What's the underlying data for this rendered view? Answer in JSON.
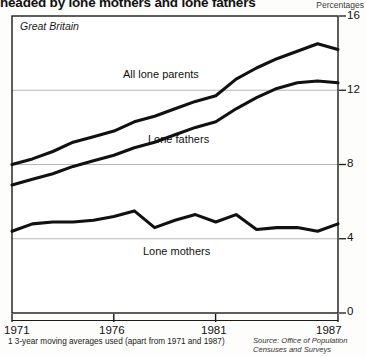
{
  "title": "headed by lone mothers and lone fathers",
  "units_label": "Percentages",
  "region_label": "Great Britain",
  "footnote": "1  3-year moving averages used (apart from 1971 and 1987)",
  "source_line1": "Source: Office of Population",
  "source_line2": "Censuses and Surveys",
  "labels": {
    "all_lone_parents": "All lone parents",
    "lone_fathers": "Lone fathers",
    "lone_mothers": "Lone mothers"
  },
  "axis": {
    "y_ticks": [
      "16",
      "12",
      "8",
      "4",
      "0"
    ],
    "x_ticks": [
      "1971",
      "1976",
      "1981",
      "1987"
    ]
  },
  "chart_data": {
    "type": "line",
    "title": "headed by lone mothers and lone fathers",
    "subtitle": "Great Britain",
    "xlabel": "",
    "ylabel": "Percentages",
    "ylim": [
      0,
      16
    ],
    "xlim": [
      1971,
      1987
    ],
    "grid": true,
    "legend": "inline-annotations",
    "yticks": [
      0,
      4,
      8,
      12,
      16
    ],
    "xticks": [
      1971,
      1976,
      1981,
      1987
    ],
    "x": [
      1971,
      1972,
      1973,
      1974,
      1975,
      1976,
      1977,
      1978,
      1979,
      1980,
      1981,
      1982,
      1983,
      1984,
      1985,
      1986,
      1987
    ],
    "series": [
      {
        "name": "All lone parents",
        "values": [
          8.0,
          8.3,
          8.7,
          9.2,
          9.5,
          9.8,
          10.3,
          10.6,
          11.0,
          11.4,
          11.7,
          12.6,
          13.2,
          13.7,
          14.1,
          14.5,
          14.2
        ]
      },
      {
        "name": "Lone fathers",
        "values": [
          6.9,
          7.2,
          7.5,
          7.9,
          8.2,
          8.5,
          8.9,
          9.2,
          9.6,
          10.0,
          10.3,
          11.0,
          11.6,
          12.1,
          12.4,
          12.5,
          12.4
        ]
      },
      {
        "name": "Lone mothers",
        "values": [
          4.4,
          4.8,
          4.9,
          4.9,
          5.0,
          5.2,
          5.5,
          4.6,
          5.0,
          5.3,
          4.9,
          5.3,
          4.5,
          4.6,
          4.6,
          4.4,
          4.8
        ]
      }
    ],
    "annotations": [
      {
        "text": "All lone parents",
        "x": 1976.5,
        "y": 12.2
      },
      {
        "text": "Lone fathers",
        "x": 1978.0,
        "y": 8.8
      },
      {
        "text": "Lone mothers",
        "x": 1977.5,
        "y": 3.2
      }
    ]
  }
}
